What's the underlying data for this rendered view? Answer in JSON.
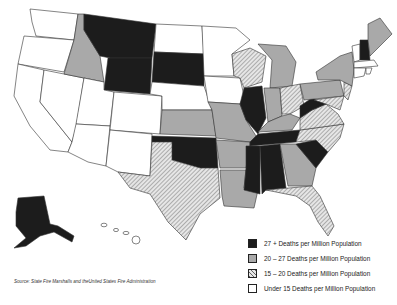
{
  "map": {
    "title": "Fire Death Rates by State",
    "colors": {
      "cat1": "#1c1c1c",
      "cat2": "#a9a9a9",
      "cat3": "hatched",
      "cat4": "#ffffff",
      "stroke": "#333333"
    },
    "categories": {
      "27+": [
        "MT",
        "WY",
        "SD",
        "OK",
        "IL",
        "MS",
        "AL",
        "TN",
        "WV",
        "SC",
        "NH",
        "AK"
      ],
      "20-27": [
        "ID",
        "KS",
        "MO",
        "AR",
        "LA",
        "IN",
        "MI",
        "KY",
        "GA",
        "PA",
        "NY",
        "ME"
      ],
      "15-20": [
        "WI",
        "TX",
        "OH",
        "VA",
        "NC",
        "FL",
        "MD",
        "DE",
        "NJ",
        "HI"
      ],
      "under15": [
        "WA",
        "OR",
        "CA",
        "NV",
        "UT",
        "AZ",
        "CO",
        "NM",
        "ND",
        "NE",
        "MN",
        "IA",
        "VT",
        "MA",
        "CT",
        "RI"
      ]
    }
  },
  "legend": {
    "items": [
      {
        "label": "27 + Deaths per Million Population",
        "style": "solid-black"
      },
      {
        "label": "20 – 27 Deaths per Million Population",
        "style": "solid-gray"
      },
      {
        "label": "15 – 20 Deaths per Million Population",
        "style": "hatched"
      },
      {
        "label": "Under 15 Deaths per Million Population",
        "style": "white"
      }
    ]
  },
  "source": "Source: State Fire Marshalls and theUnited States Fire Administration"
}
